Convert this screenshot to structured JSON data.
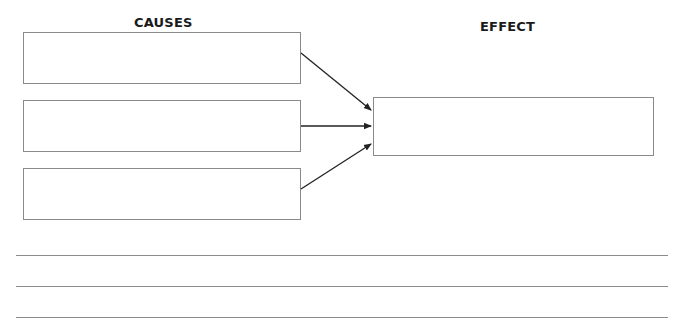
{
  "headers": {
    "causes": "CAUSES",
    "effect": "EFFECT"
  },
  "causes": [
    {
      "text": ""
    },
    {
      "text": ""
    },
    {
      "text": ""
    }
  ],
  "effect": {
    "text": ""
  },
  "writing_lines": [
    {
      "text": ""
    },
    {
      "text": ""
    },
    {
      "text": ""
    }
  ],
  "colors": {
    "box_border": "#8a8a8a",
    "arrow": "#222222",
    "text": "#1a1a1a"
  }
}
